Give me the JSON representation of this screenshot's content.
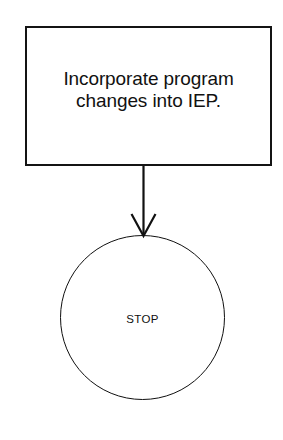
{
  "diagram": {
    "type": "flowchart",
    "background_color": "#ffffff",
    "stroke_color": "#111111",
    "nodes": [
      {
        "id": "process-incorporate",
        "shape": "rectangle",
        "role": "process",
        "label": "Incorporate program\nchanges into IEP."
      },
      {
        "id": "terminator-stop",
        "shape": "circle",
        "role": "terminator",
        "label": "STOP"
      }
    ],
    "connectors": [
      {
        "id": "process-to-stop",
        "from": "process-incorporate",
        "to": "terminator-stop",
        "direction": "down",
        "arrowhead": "open-v",
        "label": ""
      }
    ]
  }
}
